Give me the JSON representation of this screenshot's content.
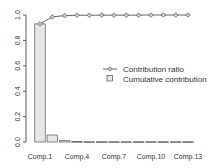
{
  "chart_data": {
    "type": "bar",
    "title": "",
    "xlabel": "",
    "ylabel": "",
    "ylim": [
      0,
      1.0
    ],
    "grid": false,
    "legend_position": "right-center",
    "categories": [
      "Comp.1",
      "Comp.2",
      "Comp.3",
      "Comp.4",
      "Comp.5",
      "Comp.6",
      "Comp.7",
      "Comp.8",
      "Comp.9",
      "Comp.10",
      "Comp.11",
      "Comp.12",
      "Comp.13"
    ],
    "x_tick_labels": [
      "Comp.1",
      "Comp.4",
      "Comp.7",
      "Comp.10",
      "Comp.13"
    ],
    "y_tick_labels": [
      "0.0",
      "0.2",
      "0.4",
      "0.6",
      "0.8",
      "1.0"
    ],
    "series": [
      {
        "name": "Cumulative contribution",
        "type": "bar",
        "values": [
          0.93,
          0.055,
          0.01,
          0.003,
          0.002,
          0.002,
          0.002,
          0.002,
          0.002,
          0.002,
          0.002,
          0.002,
          0.002
        ]
      },
      {
        "name": "Contribution ratio",
        "type": "line",
        "values": [
          0.93,
          0.985,
          0.995,
          0.998,
          0.998,
          0.999,
          0.999,
          0.999,
          0.999,
          1.0,
          1.0,
          1.0,
          1.0
        ]
      }
    ],
    "colors": {
      "bar_fill": "#e6e6e6",
      "bar_stroke": "#555555",
      "line": "#555555",
      "axis": "#333333"
    }
  },
  "legend": {
    "items": [
      {
        "label": "Contribution ratio",
        "marker": "line-diamond"
      },
      {
        "label": "Cumulative contribution",
        "marker": "square"
      }
    ]
  }
}
